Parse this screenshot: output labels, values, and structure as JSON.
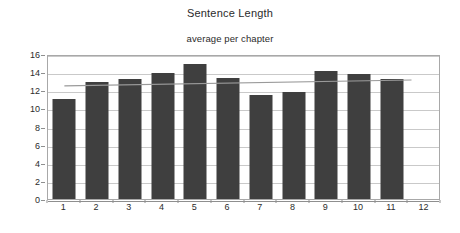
{
  "chart_data": {
    "type": "bar",
    "title": "Sentence Length",
    "subtitle": "average per chapter",
    "xlabel": "",
    "ylabel": "",
    "categories": [
      "1",
      "2",
      "3",
      "4",
      "5",
      "6",
      "7",
      "8",
      "9",
      "10",
      "11",
      "12"
    ],
    "values": [
      11.0,
      12.9,
      13.2,
      13.9,
      14.9,
      13.3,
      11.5,
      11.8,
      14.1,
      13.8,
      13.2,
      null
    ],
    "series": [
      {
        "name": "average sentence length per chapter",
        "type": "bar",
        "color": "#3f3f3f",
        "values": [
          11.0,
          12.9,
          13.2,
          13.9,
          14.9,
          13.3,
          11.5,
          11.8,
          14.1,
          13.8,
          13.2,
          null
        ]
      },
      {
        "name": "trendline",
        "type": "line",
        "color": "#9a9a9a",
        "x": [
          1,
          11.6
        ],
        "values": [
          12.7,
          13.35
        ]
      }
    ],
    "ylim": [
      0,
      16
    ],
    "yticks": [
      0,
      2,
      4,
      6,
      8,
      10,
      12,
      14,
      16
    ],
    "ytick_labels": [
      "0",
      "2",
      "4",
      "6",
      "8",
      "10",
      "12",
      "14",
      "16"
    ],
    "grid": true,
    "grid_axis": "y",
    "legend": false,
    "legend_position": "none",
    "plot_background": "#ffffff",
    "grid_color": "#c9c9c9",
    "axis_color": "#a8a8a8"
  }
}
